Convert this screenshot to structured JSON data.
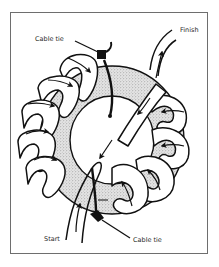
{
  "figure": {
    "labels": {
      "cable_tie_top": "Cable tie",
      "finish": "Finish",
      "start": "Start",
      "cable_tie_bottom": "Cable tie"
    },
    "icons": {
      "winding_direction": "arrow-icon",
      "core": "stippled-toroid-core",
      "tie": "cable-tie-icon"
    },
    "colors": {
      "line": "#111111",
      "core_fill": "#cfcfcf",
      "frame": "#6e6e6e",
      "background": "#ffffff"
    }
  }
}
